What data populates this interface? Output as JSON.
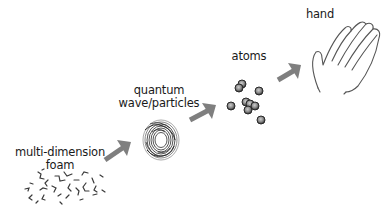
{
  "diagram": {
    "stages": [
      {
        "id": "foam",
        "label_line1": "multi-dimension",
        "label_line2": "foam"
      },
      {
        "id": "quantum",
        "label_line1": "quantum",
        "label_line2": "wave/particles"
      },
      {
        "id": "atoms",
        "label_line1": "atoms"
      },
      {
        "id": "hand",
        "label_line1": "hand"
      }
    ],
    "arrows": [
      {
        "from": "foam",
        "to": "quantum"
      },
      {
        "from": "quantum",
        "to": "atoms"
      },
      {
        "from": "atoms",
        "to": "hand"
      }
    ],
    "colors": {
      "arrow": "#7f7f7f",
      "text": "#1a1a1a",
      "atom_fill": "#8a8a8a",
      "atom_stroke": "#2a2a2a",
      "scribble": "#3a3a3a",
      "hand_outline": "#555555"
    }
  }
}
